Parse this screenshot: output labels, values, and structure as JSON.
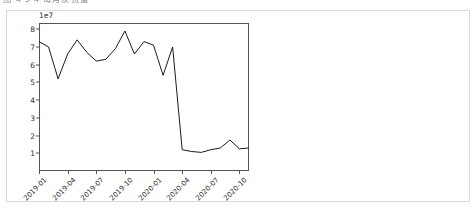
{
  "document": {
    "heading": "图 4-5 4 每月发货量"
  },
  "chart_data": {
    "type": "line",
    "title": "",
    "xlabel": "",
    "ylabel": "",
    "y_offset_label": "1e7",
    "y_scale": 10000000,
    "ylim": [
      0,
      8.35
    ],
    "yticks": [
      1,
      2,
      3,
      4,
      5,
      6,
      7,
      8
    ],
    "ytick_labels": [
      "1",
      "2",
      "3",
      "4",
      "5",
      "6",
      "7",
      "8"
    ],
    "xtick_labels": [
      "2019-01",
      "2019-04",
      "2019-07",
      "2019-10",
      "2020-01",
      "2020-04",
      "2020-07",
      "2020-10"
    ],
    "xtick_indices": [
      0,
      3,
      6,
      9,
      12,
      15,
      18,
      21
    ],
    "grid": false,
    "legend": false,
    "line_color": "#1a1a1a",
    "line_width": 1,
    "markers": false,
    "x": [
      "2019-01",
      "2019-02",
      "2019-03",
      "2019-04",
      "2019-05",
      "2019-06",
      "2019-07",
      "2019-08",
      "2019-09",
      "2019-10",
      "2019-11",
      "2019-12",
      "2020-01",
      "2020-02",
      "2020-03",
      "2020-04",
      "2020-05",
      "2020-06",
      "2020-07",
      "2020-08",
      "2020-09",
      "2020-10",
      "2020-11"
    ],
    "values": [
      7.3,
      7.0,
      5.2,
      6.6,
      7.4,
      6.7,
      6.2,
      6.3,
      6.9,
      7.9,
      6.6,
      7.3,
      7.1,
      5.4,
      7.0,
      1.2,
      1.1,
      1.05,
      1.2,
      1.3,
      1.75,
      1.25,
      1.3
    ]
  }
}
